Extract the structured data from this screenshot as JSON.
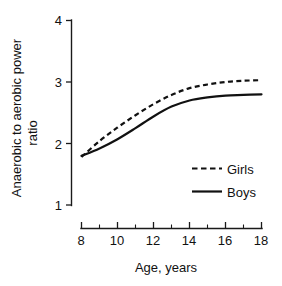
{
  "chart_data": {
    "type": "line",
    "title": "",
    "xlabel": "Age,  years",
    "ylabel_line1": "Anaerobic to aerobic power",
    "ylabel_line2": "ratio",
    "xlim": [
      8,
      18
    ],
    "ylim": [
      1,
      4
    ],
    "grid": false,
    "legend_position": "inside-lower-right",
    "x_ticks": [
      8,
      10,
      12,
      14,
      16,
      18
    ],
    "x_tick_labels": [
      "8",
      "10",
      "12",
      "14",
      "16",
      "18"
    ],
    "x_minor_ticks": [
      9,
      11,
      13,
      15,
      17
    ],
    "y_ticks": [
      1,
      2,
      3,
      4
    ],
    "y_tick_labels": [
      "1",
      "2",
      "3",
      "4"
    ],
    "x": [
      8,
      9,
      10,
      11,
      12,
      13,
      14,
      15,
      16,
      17,
      18
    ],
    "series": [
      {
        "name": "Girls",
        "style": "dashed",
        "color": "#111111",
        "values": [
          1.78,
          2.04,
          2.26,
          2.46,
          2.64,
          2.79,
          2.9,
          2.96,
          3.0,
          3.02,
          3.03
        ]
      },
      {
        "name": "Boys",
        "style": "solid",
        "color": "#111111",
        "values": [
          1.8,
          1.92,
          2.07,
          2.25,
          2.44,
          2.6,
          2.7,
          2.75,
          2.78,
          2.79,
          2.8
        ]
      }
    ],
    "legend_entries": [
      {
        "label": "Girls",
        "style": "dashed"
      },
      {
        "label": "Boys",
        "style": "solid"
      }
    ]
  },
  "axis": {
    "y_label_top": "Anaerobic to aerobic power",
    "y_label_bottom": "ratio",
    "x_label": "Age,  years",
    "y_tick_4": "4",
    "y_tick_3": "3",
    "y_tick_2": "2",
    "y_tick_1": "1",
    "x_tick_8": "8",
    "x_tick_10": "10",
    "x_tick_12": "12",
    "x_tick_14": "14",
    "x_tick_16": "16",
    "x_tick_18": "18"
  },
  "legend": {
    "girls_label": "Girls",
    "boys_label": "Boys"
  },
  "colors": {
    "ink": "#111111",
    "background": "#ffffff"
  }
}
